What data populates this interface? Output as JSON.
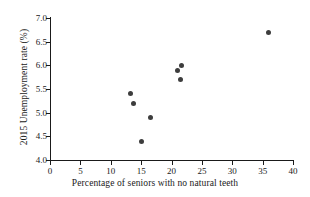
{
  "chart_data": {
    "type": "scatter",
    "title": "",
    "xlabel": "Percentage of seniors with no natural teeth",
    "ylabel": "2015 Unemployment rate (%)",
    "xlim": [
      0,
      40
    ],
    "ylim": [
      4.0,
      7.0
    ],
    "xticks": [
      0,
      5,
      10,
      15,
      20,
      25,
      30,
      35,
      40
    ],
    "xtick_labels": [
      "0",
      "5",
      "10",
      "15",
      "20",
      "25",
      "30",
      "35",
      "40"
    ],
    "yticks": [
      4.0,
      4.5,
      5.0,
      5.5,
      6.0,
      6.5,
      7.0
    ],
    "ytick_labels": [
      "4.0",
      "4.5",
      "5.0",
      "5.5",
      "6.0",
      "6.5",
      "7.0"
    ],
    "grid": false,
    "legend": false,
    "marker_color": "#3d3d3d",
    "axis_color": "#1a1a1a",
    "background": "#ffffff",
    "points": [
      {
        "x": 13.3,
        "y": 5.4
      },
      {
        "x": 13.7,
        "y": 5.2
      },
      {
        "x": 15.0,
        "y": 4.4
      },
      {
        "x": 16.6,
        "y": 4.9
      },
      {
        "x": 21.0,
        "y": 5.9
      },
      {
        "x": 21.6,
        "y": 6.0
      },
      {
        "x": 21.5,
        "y": 5.7
      },
      {
        "x": 36.0,
        "y": 6.7
      }
    ]
  }
}
